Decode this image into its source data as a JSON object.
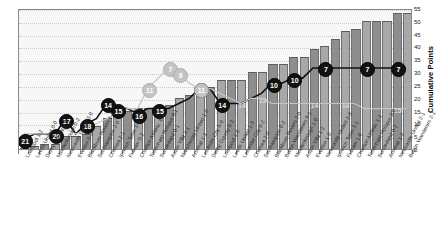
{
  "chart": {
    "type": "combo",
    "ylabel": "Cumulative Points",
    "ylim": [
      0,
      55
    ],
    "ytick_step": 5,
    "grid": true,
    "legend_position": "none",
    "colors": {
      "bar_shade_a": "#8e8e8e",
      "bar_shade_b": "#a8a8a8",
      "line_dark": "#121212",
      "line_light": "#c4c4c4",
      "plot_background": "#f7f7f7",
      "grid": "#c9c9c9"
    }
  },
  "chart_data": {
    "type": "bar",
    "title": "",
    "xlabel": "",
    "ylabel": "Cumulative Points",
    "ylim": [
      0,
      55
    ],
    "ytick_labels": [
      "0",
      "5",
      "10",
      "15",
      "20",
      "25",
      "30",
      "35",
      "40",
      "45",
      "50",
      "55"
    ],
    "categories": [
      "Liverpool 1-2",
      "Leeds United 0-0",
      "Derby County 0-0",
      "Middlesbrough 0-2",
      "Newcastle United 3-0",
      "Everton 0-3",
      "Blackburn Rovers 1-1",
      "Southampton 2-0",
      "Chelsea 2-1",
      "Ipswich Town 3-2",
      "Fulham 0-2",
      "Charlton Athletic 4-4",
      "Tottenham Hotspur 0-1",
      "Sunderland 0-1",
      "Aston Villa 1-1",
      "Manchester United 1-0",
      "Arsenal 1-1",
      "Leicester City 4-0",
      "Derby County 0-3",
      "Liverpool 1-0",
      "Leeds United 1-3",
      "Leicester City 0-2",
      "Chelsea 2-0",
      "Southampton 0-2",
      "Blackburn Rovers 2-0",
      "Bolton Wanderers 0-1",
      "Middlesbrough 1-0",
      "Aston Villa 1-2",
      "Everton 1-0",
      "Newcastle United 3-3",
      "Ipswich Town 3-1",
      "Fulham 1-0",
      "Charlton Athletic 1-1",
      "Tottenham Hotspur 3-0",
      "Sunderland 0-2",
      "Arsenal 1-3",
      "Newcastle United 2-1",
      "Bolton Wanderers 2-1"
    ],
    "series": [
      {
        "name": "Cumulative Points",
        "type": "bar",
        "values": [
          0,
          1,
          2,
          2,
          5,
          5,
          6,
          9,
          12,
          15,
          15,
          16,
          16,
          16,
          17,
          20,
          21,
          24,
          24,
          27,
          27,
          27,
          30,
          30,
          33,
          33,
          36,
          36,
          39,
          40,
          43,
          46,
          47,
          50,
          50,
          50,
          53,
          53
        ]
      },
      {
        "name": "League Position",
        "type": "line",
        "style": "dark",
        "values": [
          21,
          20,
          20,
          20,
          17,
          20,
          18,
          17,
          14,
          15,
          15,
          16,
          15,
          15,
          15,
          14,
          13,
          11,
          11,
          14,
          14,
          14,
          13,
          12,
          10,
          10,
          9,
          9,
          7,
          7,
          7,
          7,
          7,
          7,
          7,
          7,
          7,
          7
        ],
        "point_labels": [
          {
            "index": 0,
            "text": "21"
          },
          {
            "index": 3,
            "text": "20"
          },
          {
            "index": 4,
            "text": "17"
          },
          {
            "index": 6,
            "text": "18"
          },
          {
            "index": 9,
            "text": "15"
          },
          {
            "index": 11,
            "text": "16"
          },
          {
            "index": 8,
            "text": "14"
          },
          {
            "index": 13,
            "text": "15"
          },
          {
            "index": 17,
            "text": "11"
          },
          {
            "index": 19,
            "text": "14"
          },
          {
            "index": 24,
            "text": "10"
          },
          {
            "index": 26,
            "text": "10"
          },
          {
            "index": 29,
            "text": "7"
          },
          {
            "index": 33,
            "text": "7"
          },
          {
            "index": 36,
            "text": "7"
          }
        ]
      },
      {
        "name": "Opponent Position",
        "type": "line",
        "style": "light",
        "values": [
          20,
          20,
          20,
          20,
          19,
          20,
          19,
          18,
          17,
          16,
          15,
          15,
          11,
          9,
          7,
          8,
          10,
          11,
          11,
          12,
          13,
          14,
          13,
          13,
          14,
          14,
          14,
          14,
          14,
          14,
          14,
          14,
          14,
          15,
          15,
          15,
          15,
          15
        ],
        "point_labels": [
          {
            "index": 6,
            "text": "17"
          },
          {
            "index": 9,
            "text": "15"
          },
          {
            "index": 12,
            "text": "11"
          },
          {
            "index": 14,
            "text": "7"
          },
          {
            "index": 15,
            "text": "8"
          },
          {
            "index": 17,
            "text": "11"
          },
          {
            "index": 21,
            "text": "14"
          },
          {
            "index": 23,
            "text": "13"
          },
          {
            "index": 28,
            "text": "14"
          },
          {
            "index": 31,
            "text": "14"
          },
          {
            "index": 36,
            "text": "15"
          }
        ]
      }
    ]
  }
}
